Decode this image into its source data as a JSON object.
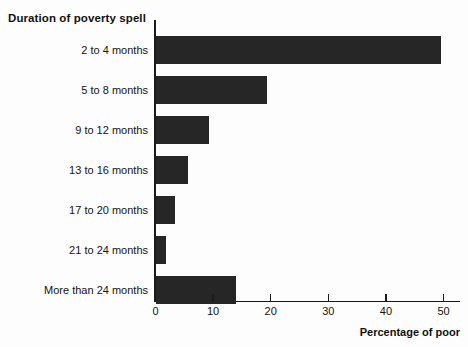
{
  "chart_data": {
    "type": "bar",
    "orientation": "horizontal",
    "title": "Duration of poverty spell",
    "xlabel": "Percentage of poor",
    "ylabel": "",
    "categories": [
      "2 to 4 months",
      "5 to 8 months",
      "9 to 12 months",
      "13 to 16 months",
      "17 to 20 months",
      "21 to 24 months",
      "More than 24 months"
    ],
    "values": [
      49.5,
      19.4,
      9.3,
      5.7,
      3.3,
      1.9,
      14.0
    ],
    "xlim": [
      0,
      53
    ],
    "xticks": [
      0,
      10,
      20,
      30,
      40,
      50
    ],
    "xtick_labels": [
      "0",
      "10",
      "20",
      "30",
      "40",
      "50"
    ],
    "grid": false,
    "legend": false,
    "bar_color": "#262626",
    "axis_color": "#1a1a1a",
    "background_color": "#fdfdfd"
  }
}
